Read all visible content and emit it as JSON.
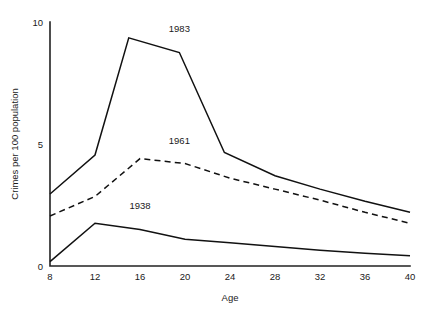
{
  "chart_data": {
    "type": "line",
    "title": "",
    "xlabel": "Age",
    "ylabel": "Crimes per 100 population",
    "xlim": [
      8,
      40
    ],
    "ylim": [
      0,
      10
    ],
    "xticks": [
      8,
      12,
      16,
      20,
      24,
      28,
      32,
      36,
      40
    ],
    "xtick_labels": [
      "8",
      "12",
      "16",
      "20",
      "24",
      "28",
      "32",
      "36",
      "40"
    ],
    "yticks": [
      0,
      5,
      10
    ],
    "ytick_labels": [
      "0",
      "5",
      "10"
    ],
    "grid": false,
    "legend_position": "inline-annotations",
    "series": [
      {
        "name": "1983",
        "style": "solid",
        "color": "#111111",
        "label_x": 19.5,
        "label_y": 9.6,
        "x": [
          8,
          12,
          15,
          19.5,
          23.5,
          28,
          32,
          36,
          40
        ],
        "values": [
          2.95,
          4.55,
          9.35,
          8.75,
          4.65,
          3.7,
          3.15,
          2.65,
          2.2
        ]
      },
      {
        "name": "1961",
        "style": "dashed",
        "color": "#111111",
        "label_x": 19.5,
        "label_y": 5.0,
        "x": [
          8,
          12,
          16,
          20,
          24,
          28,
          32,
          36,
          40
        ],
        "values": [
          2.05,
          2.85,
          4.4,
          4.2,
          3.6,
          3.15,
          2.7,
          2.2,
          1.75
        ]
      },
      {
        "name": "1938",
        "style": "solid",
        "color": "#111111",
        "label_x": 16.0,
        "label_y": 2.35,
        "x": [
          8,
          12,
          16,
          20,
          24,
          28,
          32,
          36,
          40
        ],
        "values": [
          0.18,
          1.75,
          1.5,
          1.1,
          0.95,
          0.8,
          0.65,
          0.52,
          0.42
        ]
      }
    ]
  },
  "figure": {
    "background_color": "#ffffff",
    "line_color": "#111111",
    "axis_color": "#222222"
  }
}
